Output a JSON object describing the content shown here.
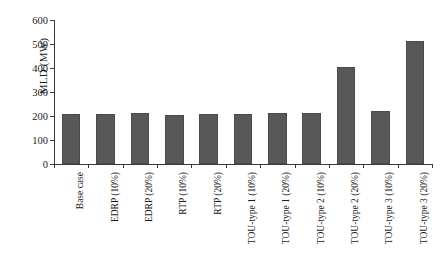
{
  "chart_data": {
    "type": "bar",
    "title": "",
    "xlabel": "",
    "ylabel": "MLD (MW)",
    "ylim": [
      0,
      600
    ],
    "ytick_labels": [
      "0",
      "100",
      "200",
      "300",
      "400",
      "500",
      "600"
    ],
    "ytick_values": [
      0,
      100,
      200,
      300,
      400,
      500,
      600
    ],
    "grid": false,
    "legend": "none",
    "bar_color": "#585858",
    "axis_color": "#3a3a3a",
    "categories": [
      "Base case",
      "EDRP (10%)",
      "EDRP (20%)",
      "RTP (10%)",
      "RTP (20%)",
      "TOU-type 1 (10%)",
      "TOU-type 1 (20%)",
      "TOU-type 2 (10%)",
      "TOU-type 2 (20%)",
      "TOU-type 3 (10%)",
      "TOU-type 3 (20%)"
    ],
    "values": [
      207,
      208,
      212,
      206,
      210,
      207,
      213,
      211,
      403,
      221,
      511
    ]
  }
}
